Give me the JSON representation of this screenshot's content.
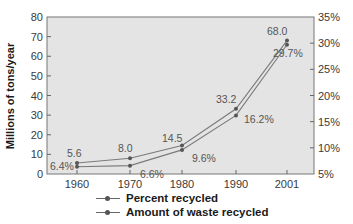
{
  "chart_data": {
    "type": "line",
    "title": "",
    "xlabel": "",
    "ylabel": "Millions of tons/year",
    "ylabel_right": "",
    "categories": [
      "1960",
      "1970",
      "1980",
      "1990",
      "2001"
    ],
    "ylim": [
      0,
      80
    ],
    "ylim_right": [
      5,
      35
    ],
    "yticks": [
      "0",
      "10",
      "20",
      "30",
      "40",
      "50",
      "60",
      "70",
      "80"
    ],
    "yticks_right": [
      "5%",
      "10%",
      "15%",
      "20%",
      "25%",
      "30%",
      "35%"
    ],
    "grid": false,
    "legend_position": "bottom",
    "series": [
      {
        "name": "Percent recycled",
        "axis": "right",
        "values": [
          6.4,
          6.6,
          9.6,
          16.2,
          29.7
        ],
        "labels": [
          "6.4%",
          "6.6%",
          "9.6%",
          "16.2%",
          "29.7%"
        ]
      },
      {
        "name": "Amount of waste recycled",
        "axis": "left",
        "values": [
          5.6,
          8.0,
          14.5,
          33.2,
          68.0
        ],
        "labels": [
          "5.6",
          "8.0",
          "14.5",
          "33.2",
          "68.0"
        ]
      }
    ]
  },
  "legend": {
    "items": [
      {
        "label": "Percent recycled"
      },
      {
        "label": "Amount of waste recycled"
      }
    ]
  },
  "colors": {
    "plot_bg": "#e6e6e6",
    "line": "#777777",
    "marker": "#555555",
    "axis": "#666666"
  }
}
